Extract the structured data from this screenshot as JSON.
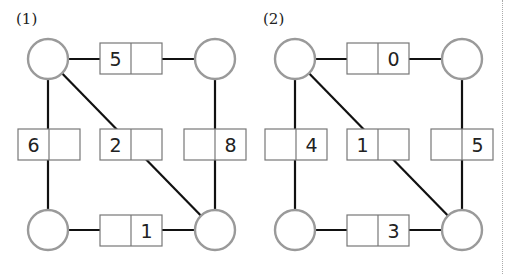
{
  "diagrams": [
    {
      "label": "(1)",
      "offset_x": 0,
      "nodes": [
        {
          "id": "tl",
          "cx": 48,
          "cy": 59
        },
        {
          "id": "tr",
          "cx": 215,
          "cy": 59
        },
        {
          "id": "bl",
          "cx": 48,
          "cy": 230
        },
        {
          "id": "br",
          "cx": 215,
          "cy": 230
        }
      ],
      "edges": [
        {
          "from": "tl",
          "to": "tr",
          "box": {
            "x": 100,
            "y": 43,
            "left": "5",
            "right": ""
          }
        },
        {
          "from": "tl",
          "to": "bl",
          "box": {
            "x": 18,
            "y": 129,
            "left": "6",
            "right": ""
          }
        },
        {
          "from": "tl",
          "to": "br",
          "box": {
            "x": 100,
            "y": 129,
            "left": "2",
            "right": ""
          }
        },
        {
          "from": "tr",
          "to": "br",
          "box": {
            "x": 184,
            "y": 129,
            "left": "",
            "right": "8"
          }
        },
        {
          "from": "bl",
          "to": "br",
          "box": {
            "x": 100,
            "y": 215,
            "left": "",
            "right": "1"
          }
        }
      ]
    },
    {
      "label": "(2)",
      "offset_x": 247,
      "nodes": [
        {
          "id": "tl",
          "cx": 48,
          "cy": 59
        },
        {
          "id": "tr",
          "cx": 215,
          "cy": 59
        },
        {
          "id": "bl",
          "cx": 48,
          "cy": 230
        },
        {
          "id": "br",
          "cx": 215,
          "cy": 230
        }
      ],
      "edges": [
        {
          "from": "tl",
          "to": "tr",
          "box": {
            "x": 100,
            "y": 43,
            "left": "",
            "right": "0"
          }
        },
        {
          "from": "tl",
          "to": "bl",
          "box": {
            "x": 18,
            "y": 129,
            "left": "",
            "right": "4"
          }
        },
        {
          "from": "tl",
          "to": "br",
          "box": {
            "x": 100,
            "y": 129,
            "left": "1",
            "right": ""
          }
        },
        {
          "from": "tr",
          "to": "br",
          "box": {
            "x": 184,
            "y": 129,
            "left": "",
            "right": "5"
          }
        },
        {
          "from": "bl",
          "to": "br",
          "box": {
            "x": 100,
            "y": 215,
            "left": "",
            "right": "3"
          }
        }
      ]
    }
  ],
  "style": {
    "edge_color": "#111111",
    "node_stroke": "#9a9a9a",
    "box_stroke": "#777777"
  }
}
